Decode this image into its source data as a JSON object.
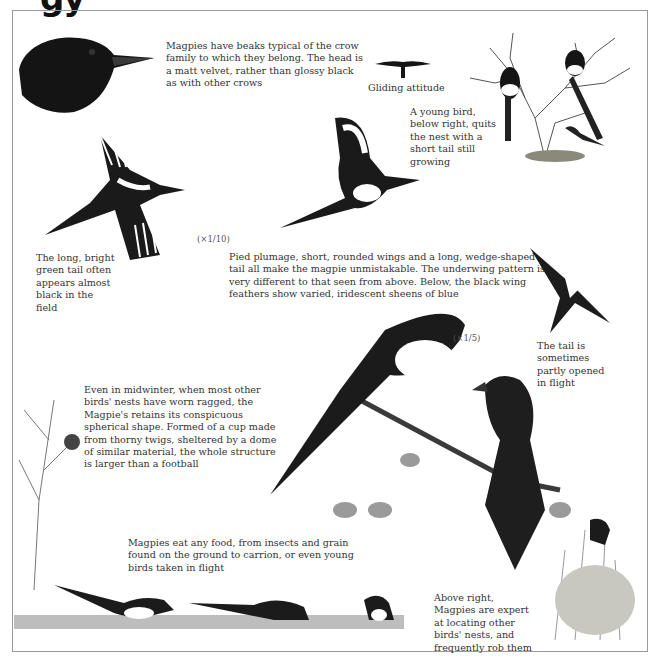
{
  "page": {
    "heading_fragment": "gy",
    "frame_color": "#9a9a9a"
  },
  "captions": {
    "beak": "Magpies have beaks typical of the crow family to which they belong. The head is a matt velvet, rather than glossy black as with other crows",
    "gliding": "Gliding attitude",
    "young": "A young bird, below right, quits the nest with a short tail still growing",
    "tail_green": "The long, bright green tail often appears almost black in the field",
    "pied": "Pied plumage, short, rounded wings and a long, wedge-shaped tail all make the magpie unmistakable. The underwing pattern is very different to that seen from above. Below, the black wing feathers show varied, iridescent sheens of blue",
    "tail_open": "The tail is sometimes partly opened in flight",
    "nest": "Even in midwinter, when most other birds' nests have worn ragged, the Magpie's retains its conspicuous spherical shape. Formed of a cup made from thorny twigs, sheltered by a dome of similar material, the whole structure is larger than a football",
    "food": "Magpies eat any food, from insects and grain found on the ground to carrion, or even young birds taken in flight",
    "rob": "Above right, Magpies are expert at locating other birds' nests, and frequently rob them"
  },
  "scales": {
    "flight": "(×1/10)",
    "perched": "(×1/5)"
  },
  "illustrations": [
    {
      "name": "magpie-head",
      "label": "Magpie head profile"
    },
    {
      "name": "gliding-silhouette",
      "label": "Gliding attitude silhouette"
    },
    {
      "name": "tree-with-young",
      "label": "Magpies in bare tree with young bird"
    },
    {
      "name": "flight-underwing",
      "label": "Magpie in flight from below"
    },
    {
      "name": "flight-upperwing",
      "label": "Magpie in flight from above"
    },
    {
      "name": "flight-tail-open",
      "label": "Magpie with tail partly opened"
    },
    {
      "name": "spherical-nest",
      "label": "Nest in winter tree"
    },
    {
      "name": "perched-pair",
      "label": "Two magpies perched on branch"
    },
    {
      "name": "nest-robbing",
      "label": "Magpie at nest in bush"
    },
    {
      "name": "ground-feeding",
      "label": "Magpies feeding on ground"
    }
  ]
}
